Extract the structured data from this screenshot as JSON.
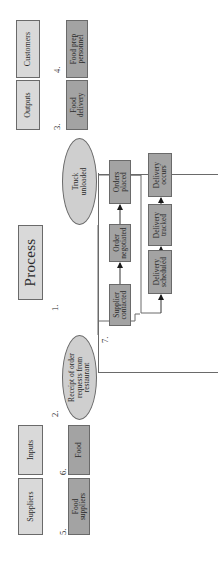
{
  "diagram": {
    "type": "SIPOC process map (rotated 90° counter-clockwise)",
    "headers": {
      "suppliers": "Suppliers",
      "inputs": "Inputs",
      "process": "Process",
      "outputs": "Outputs",
      "customers": "Customers"
    },
    "numbers": {
      "n1": "1.",
      "n2": "2.",
      "n3": "3.",
      "n4": "4.",
      "n5": "5.",
      "n6": "6.",
      "n7": "7."
    },
    "items": {
      "food_suppliers": "Food\nsuppliers",
      "food": "Food",
      "receipt": "Receipt of order\nrequests from\nrestaurant",
      "truck_unloaded": "Truck\nunloaded",
      "food_delivery": "Food\ndelivery",
      "food_prep": "Food prep\npersonnel"
    },
    "steps_row1": [
      {
        "label": "Supplier\ncontacted"
      },
      {
        "label": "Order\nnegotiated"
      },
      {
        "label": "Orders\nplaced"
      }
    ],
    "steps_row2": [
      {
        "label": "Delivery\nscheduled"
      },
      {
        "label": "Delivery\ntracked"
      },
      {
        "label": "Delivery\noccurs"
      }
    ],
    "colors": {
      "header_fill": "#d9d9d9",
      "item_fill": "#a3a3a3",
      "ellipse_fill": "#cfcfcf",
      "border": "#6a6a6a"
    }
  }
}
